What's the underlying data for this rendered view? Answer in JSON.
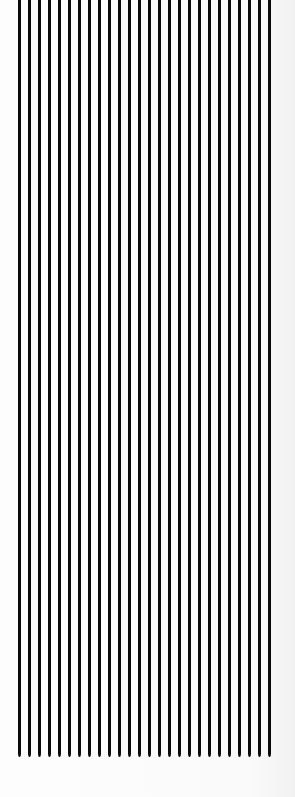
{
  "image": {
    "description": "Vertical black parallel lines on a white background",
    "line_count": 26,
    "line_color": "#0a0a0a",
    "background_color": "#fbfbfb",
    "line_start_x": 18,
    "line_spacing": 10,
    "line_width": 3,
    "line_top": 0,
    "line_bottom": 757
  }
}
